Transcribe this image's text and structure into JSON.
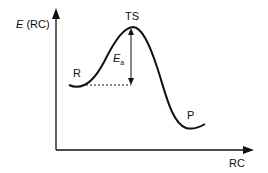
{
  "diagram": {
    "y_axis_label": "E (RC)",
    "y_axis_label_italic": "E",
    "y_axis_label_rest": " (RC)",
    "x_axis_label": "RC",
    "transition_state_label": "TS",
    "reactant_label": "R",
    "product_label": "P",
    "activation_energy_label": "E",
    "activation_energy_subscript": "a",
    "line_color": "#111111"
  }
}
